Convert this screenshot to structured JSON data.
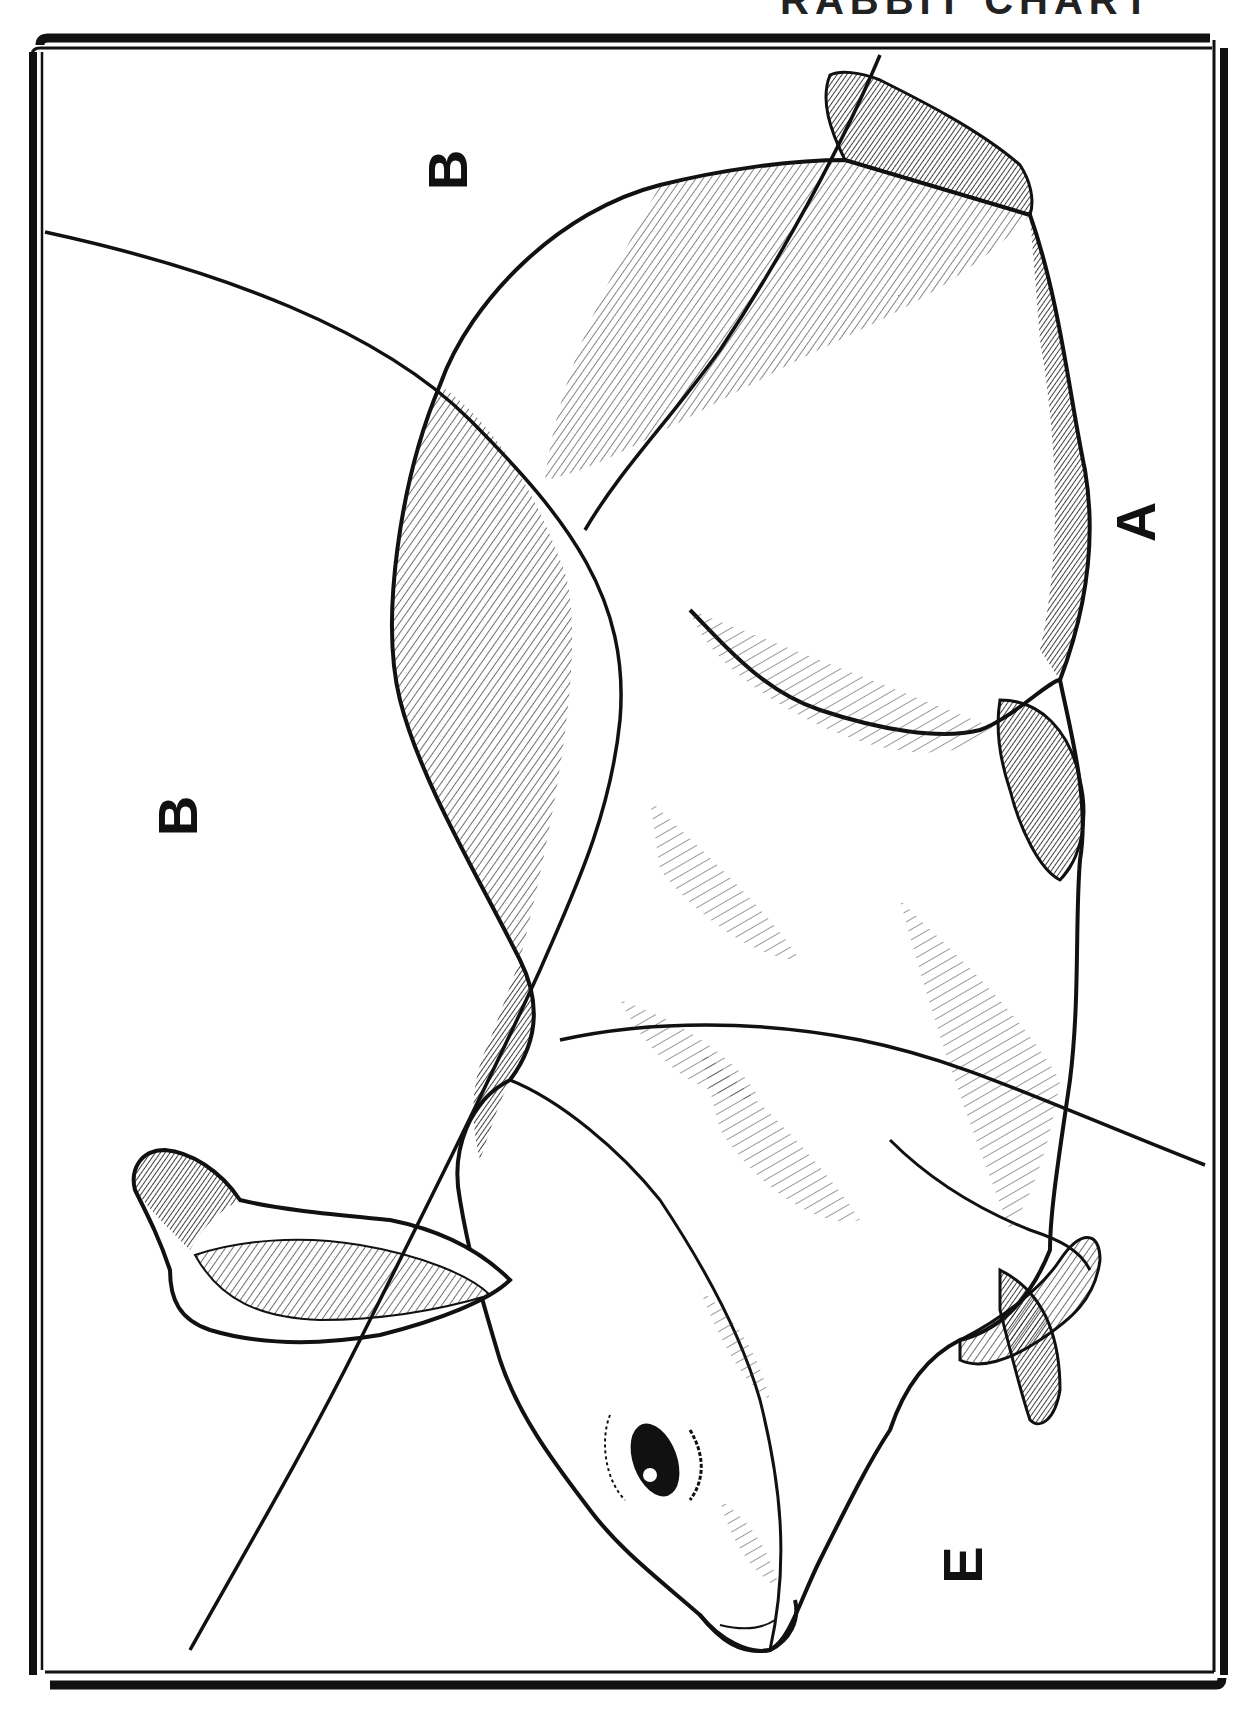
{
  "page": {
    "title_fragment": "RABBIT CHART",
    "orientation": "rotated 90 degrees counter-clockwise"
  },
  "labels": [
    {
      "id": "B1",
      "text": "B",
      "x": 415,
      "y": 160
    },
    {
      "id": "B2",
      "text": "B",
      "x": 165,
      "y": 748
    },
    {
      "id": "A",
      "text": "A",
      "x": 1040,
      "y": 478
    },
    {
      "id": "E",
      "text": "E",
      "x": 880,
      "y": 1545
    }
  ],
  "colors": {
    "ink": "#111111",
    "paper": "#ffffff"
  }
}
